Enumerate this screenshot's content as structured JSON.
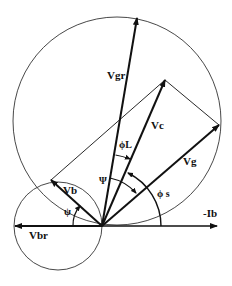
{
  "diagram": {
    "labels": {
      "vgr": "Vgr",
      "vc": "Vc",
      "vg": "Vg",
      "vb": "Vb",
      "vbr": "Vbr",
      "neg_ib": "-Ib",
      "phi_l": "ϕL",
      "phi_s": "ϕ s",
      "psi_upper": "Ψ",
      "psi_lower": "ψ"
    },
    "colors": {
      "stroke": "#111111",
      "circle": "#333333",
      "background": "#ffffff"
    }
  }
}
